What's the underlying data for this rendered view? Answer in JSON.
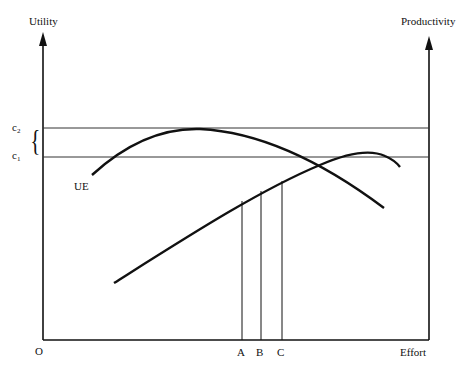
{
  "diagram": {
    "axes": {
      "left_label": "Utility",
      "right_label": "Productivity",
      "x_label": "Effort",
      "origin_label": "O"
    },
    "levels": [
      {
        "id": "c2",
        "base": "c",
        "sub": "2"
      },
      {
        "id": "c1",
        "base": "c",
        "sub": "1"
      }
    ],
    "curve_labels": {
      "ue": "UE"
    },
    "effort_points": [
      "A",
      "B",
      "C"
    ],
    "brace_glyph": "{"
  },
  "colors": {
    "ink": "#111111",
    "thin_line": "#333333",
    "background": "#ffffff"
  }
}
